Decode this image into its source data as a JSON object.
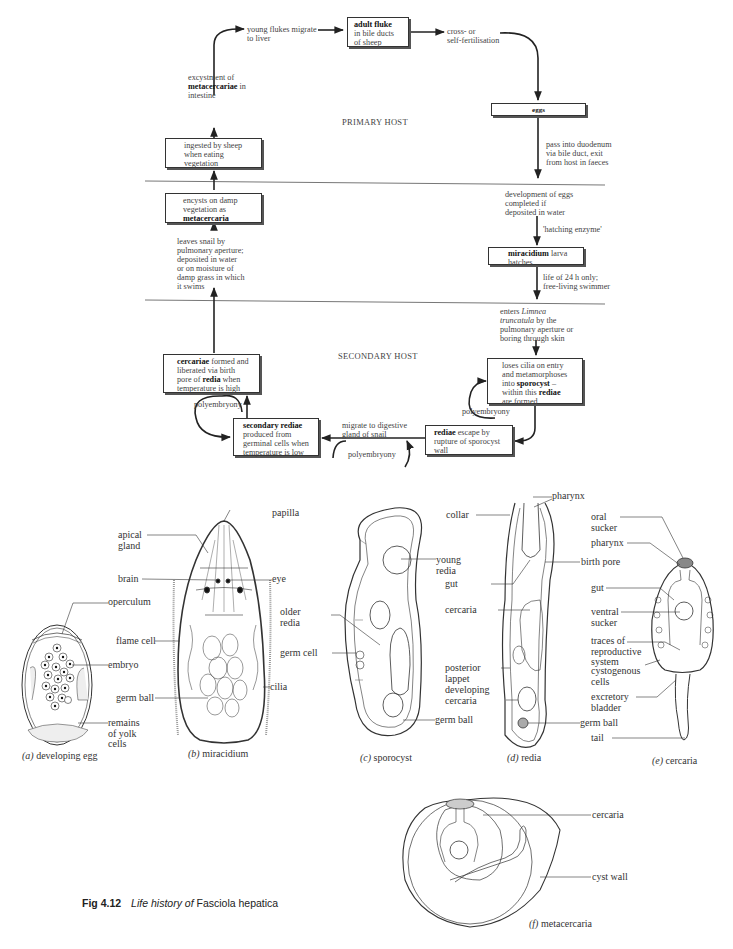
{
  "cycle": {
    "hosts": {
      "primary": "PRIMARY HOST",
      "secondary": "SECONDARY HOST"
    },
    "nodes": {
      "adult_fluke": {
        "bold": "adult fluke",
        "text": "in bile ducts\nof sheep"
      },
      "cross_fert": "cross- or\nself-fertilisation",
      "eggs": {
        "bold": "eggs"
      },
      "pass_duodenum": "pass into duodenum\nvia bile duct, exit\nfrom host in faeces",
      "development": "development of eggs\ncompleted if\ndeposited in water",
      "hatching_enzyme": "'hatching enzyme'",
      "miracidium": {
        "bold": "miracidium",
        "text": " larva\nhatches"
      },
      "life_24h": "life of 24 h only;\nfree-living swimmer",
      "enters_limnea": {
        "pre": "enters ",
        "italic": "Limnea\ntruncatula",
        "post": " by the\npulmonary aperture or\nboring through skin"
      },
      "loses_cilia": {
        "pre": "loses cilia on entry\nand metamorphoses\ninto ",
        "bold1": "sporocyst",
        "mid": " –\nwithin this ",
        "bold2": "rediae",
        "post": "\nare formed"
      },
      "rediae_escape": {
        "bold": "rediae",
        "text": " escape by\nrupture of sporocyst\nwall"
      },
      "migrate_digestive": "migrate to digestive\ngland of snail",
      "secondary_rediae": {
        "bold": "secondary rediae",
        "text": "\nproduced from\ngerminal cells when\ntemperature is low"
      },
      "cercariae_formed": {
        "bold1": "cercariae",
        "t1": " formed and\nliberated via birth\npore of ",
        "bold2": "redia",
        "t2": " when\ntemperature is high"
      },
      "polyembryony": [
        "polyembryony",
        "polyembryony",
        "polyembryony"
      ],
      "leaves_snail": "leaves snail by\npulmonary aperture;\ndeposited in water\nor on moisture of\ndamp grass in which\nit swims",
      "encysts": {
        "text": "encysts on damp\nvegetation as\n",
        "bold": "metacercaria"
      },
      "ingested": "ingested by sheep\nwhen eating\nvegetation",
      "excystment": {
        "t1": "excystment of\n",
        "bold": "metacercariae",
        "t2": " in\nintestine"
      },
      "young_flukes": "young flukes migrate\nto liver"
    }
  },
  "drawings": {
    "a": {
      "caption_letter": "(a)",
      "caption": " developing egg",
      "labels": [
        "operculum",
        "embryo",
        "remains\nof yolk\ncells"
      ]
    },
    "b": {
      "caption_letter": "(b)",
      "caption": " miracidium",
      "labels": [
        "apical\ngland",
        "papilla",
        "brain",
        "eye",
        "flame cell",
        "germ ball",
        "cilia"
      ]
    },
    "c": {
      "caption_letter": "(c)",
      "caption": " sporocyst",
      "labels": [
        "young\nredia",
        "older\nredia",
        "germ cell",
        "germ ball"
      ]
    },
    "d": {
      "caption_letter": "(d)",
      "caption": " redia",
      "labels": [
        "pharynx",
        "collar",
        "birth pore",
        "gut",
        "cercaria",
        "posterior\nlappet",
        "developing\ncercaria",
        "germ ball"
      ]
    },
    "e": {
      "caption_letter": "(e)",
      "caption": " cercaria",
      "labels": [
        "oral\nsucker",
        "pharynx",
        "gut",
        "ventral\nsucker",
        "traces of\nreproductive\nsystem",
        "cystogenous\ncells",
        "excretory\nbladder",
        "tail"
      ]
    },
    "f": {
      "caption_letter": "(f)",
      "caption": " metacercaria",
      "labels": [
        "cercaria",
        "cyst wall"
      ]
    }
  },
  "figure_caption": {
    "number": "Fig 4.12",
    "italic": "Life history of",
    "species": " Fasciola hepatica"
  }
}
